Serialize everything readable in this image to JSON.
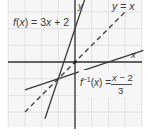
{
  "diagram": {
    "grid": {
      "color": "#e4e4e4",
      "background": "#f6f6f6",
      "unit_px": 16.7,
      "x_range": [
        -4,
        4
      ],
      "y_range": [
        -4,
        3.7
      ]
    },
    "axes": {
      "color": "#333333",
      "x_label": "x",
      "y_label": "y"
    },
    "curves": [
      {
        "name": "f",
        "label": "f(x) = 3x + 2",
        "equation": "3x+2",
        "style": "solid",
        "color": "#3a3a3a"
      },
      {
        "name": "f_inverse",
        "label_lhs": "f⁻¹(x) =",
        "label_num": "x − 2",
        "label_den": "3",
        "equation": "(x-2)/3",
        "style": "solid",
        "color": "#3a3a3a"
      },
      {
        "name": "identity",
        "label": "y = x",
        "equation": "x",
        "style": "dashed",
        "color": "#3a3a3a"
      }
    ],
    "intersection": {
      "x": -1,
      "y": -1
    },
    "origin_marker": true
  },
  "labels": {
    "f": "f(x) = 3x + 2",
    "yx": "y = x",
    "finv_lhs": "f⁻¹(x) =",
    "finv_num": "x − 2",
    "finv_den": "3",
    "x_axis": "x",
    "y_axis": "y"
  }
}
